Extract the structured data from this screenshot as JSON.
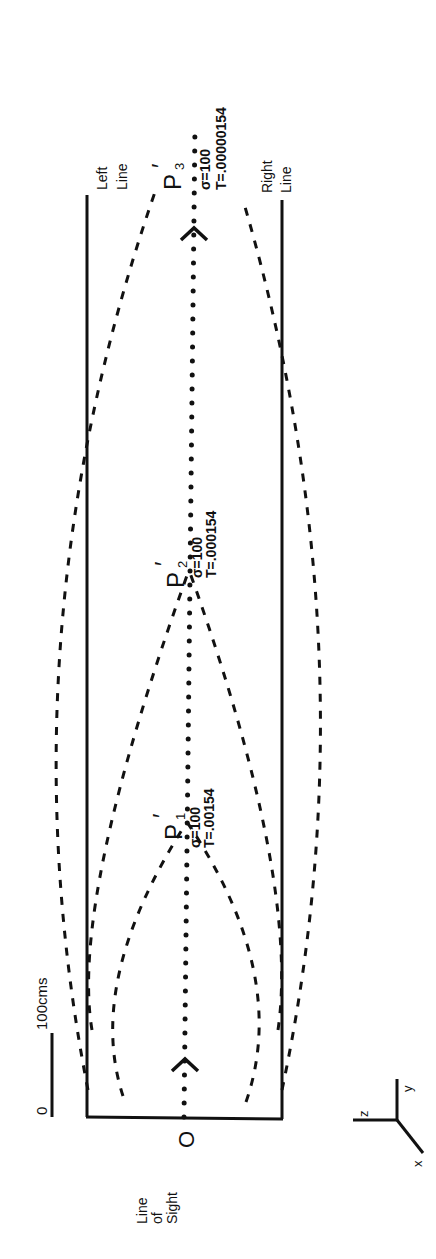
{
  "diagram": {
    "orientation": "rotated-90-ccw",
    "scale_bar": {
      "zero_label": "0",
      "length_label": "100cms"
    },
    "origin_label": "O",
    "line_of_sight_label": [
      "Line",
      "of",
      "Sight"
    ],
    "left_line_label": [
      "Left",
      "Line"
    ],
    "right_line_label": [
      "Right",
      "Line"
    ],
    "axes": {
      "x": "x",
      "y": "y",
      "z": "z"
    },
    "points": [
      {
        "name": "P",
        "sub": "1",
        "prime": "′",
        "sigma": "σ=100",
        "T": "T=.00154"
      },
      {
        "name": "P",
        "sub": "2",
        "prime": "′",
        "sigma": "σ=100",
        "T": "T=.000154"
      },
      {
        "name": "P",
        "sub": "3",
        "prime": "′",
        "sigma": "σ=100",
        "T": "T=.00000154"
      }
    ],
    "colors": {
      "ink": "#111111",
      "background": "#ffffff"
    }
  }
}
